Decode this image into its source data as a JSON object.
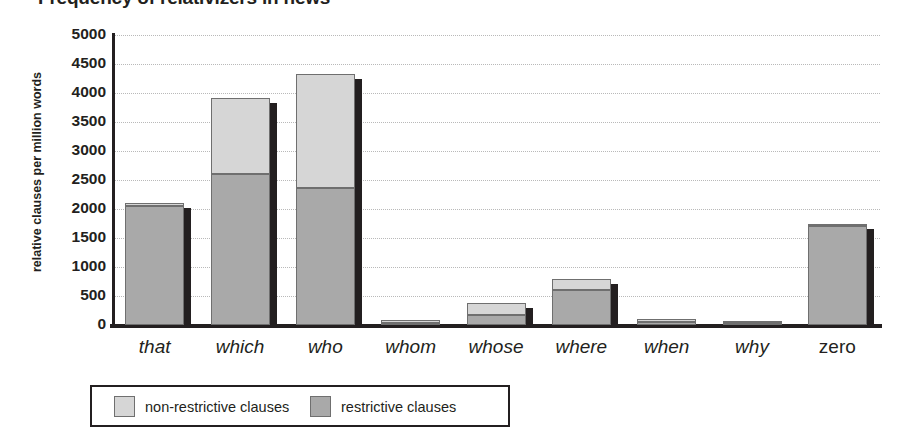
{
  "chart_data": {
    "type": "bar",
    "subtype": "stacked",
    "title": "Frequency of relativizers in news",
    "xlabel": "",
    "ylabel": "relative clauses per million words",
    "ylim": [
      0,
      5000
    ],
    "ytick_labels": [
      "5000",
      "4500",
      "4000",
      "3500",
      "3000",
      "2500",
      "2000",
      "1500",
      "1000",
      "500",
      "0"
    ],
    "ytick_values": [
      5000,
      4500,
      4000,
      3500,
      3000,
      2500,
      2000,
      1500,
      1000,
      500,
      0
    ],
    "grid": true,
    "grid_style": "dotted-horizontal",
    "legend_position": "bottom-left",
    "categories": [
      "that",
      "which",
      "who",
      "whom",
      "whose",
      "where",
      "when",
      "why",
      "zero"
    ],
    "categories_style": [
      "italic",
      "italic",
      "italic",
      "italic",
      "italic",
      "italic",
      "italic",
      "italic",
      "upright"
    ],
    "series": [
      {
        "name": "restrictive clauses",
        "color": "#a9a9a9",
        "values": [
          2060,
          2600,
          2370,
          40,
          180,
          600,
          60,
          30,
          1700
        ]
      },
      {
        "name": "non-restrictive clauses",
        "color": "#d6d6d6",
        "values": [
          40,
          1320,
          1960,
          40,
          200,
          200,
          50,
          30,
          50
        ]
      }
    ],
    "totals": [
      2100,
      3920,
      4330,
      80,
      380,
      800,
      110,
      60,
      1750
    ]
  },
  "legend": {
    "items": [
      {
        "label": "non-restrictive clauses",
        "color": "#d6d6d6"
      },
      {
        "label": "restrictive clauses",
        "color": "#a9a9a9"
      }
    ]
  },
  "colors": {
    "axis": "#231f20",
    "grid": "#b9b9b9",
    "background": "#ffffff",
    "restrictive": "#a9a9a9",
    "non_restrictive": "#d6d6d6",
    "bar_outline": "#6f6f6f",
    "bar_shadow": "#231f20"
  }
}
